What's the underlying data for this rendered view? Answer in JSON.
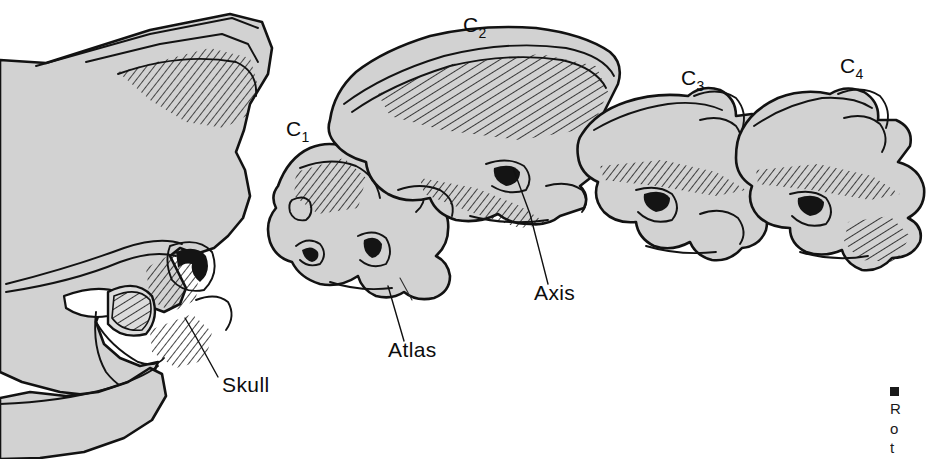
{
  "figure": {
    "kind": "anatomical-line-drawing",
    "background_color": "#ffffff",
    "bone_fill_color": "#d2d2d2",
    "outline_color": "#121212",
    "label_color": "#0d0d0d"
  },
  "labels": {
    "c1": {
      "base": "C",
      "sub": "1",
      "x": 286,
      "y": 136
    },
    "c2": {
      "base": "C",
      "sub": "2",
      "x": 463,
      "y": 32
    },
    "c3": {
      "base": "C",
      "sub": "3",
      "x": 681,
      "y": 85
    },
    "c4": {
      "base": "C",
      "sub": "4",
      "x": 840,
      "y": 73
    },
    "skull": {
      "text": "Skull",
      "x": 222,
      "y": 392
    },
    "atlas": {
      "text": "Atlas",
      "x": 388,
      "y": 357
    },
    "axis": {
      "text": "Axis",
      "x": 534,
      "y": 300
    }
  },
  "leaders": [
    {
      "name": "skull-leader",
      "d": "M 218 377 L 196 337 L 185 318"
    },
    {
      "name": "atlas-leader",
      "d": "M 404 341 L 388 286"
    },
    {
      "name": "axis-leader",
      "d": "M 548 284 L 530 214 L 513 168"
    }
  ],
  "caption": {
    "marker": "■",
    "lines": [
      "R",
      "o",
      "t"
    ]
  }
}
